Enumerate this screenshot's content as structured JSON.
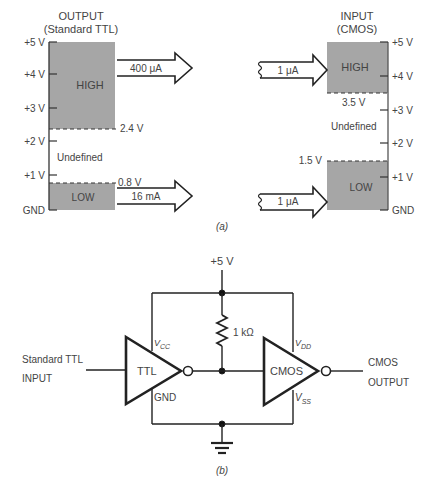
{
  "part_a": {
    "caption": "(a)",
    "output": {
      "title_line1": "OUTPUT",
      "title_line2": "(Standard TTL)",
      "axis_ticks": [
        "+5 V",
        "+4 V",
        "+3 V",
        "+2 V",
        "+1 V",
        "GND"
      ],
      "high_label": "HIGH",
      "low_label": "LOW",
      "undefined_label": "Undefined",
      "high_threshold": "2.4 V",
      "low_threshold": "0.8 V",
      "high_current": "400 μA",
      "low_current": "16 mA"
    },
    "input": {
      "title_line1": "INPUT",
      "title_line2": "(CMOS)",
      "axis_ticks": [
        "+5 V",
        "+4 V",
        "+3 V",
        "+2 V",
        "+1 V",
        "GND"
      ],
      "high_label": "HIGH",
      "low_label": "LOW",
      "undefined_label": "Undefined",
      "high_threshold": "3.5 V",
      "low_threshold": "1.5 V",
      "high_current": "1 μA",
      "low_current": "1 μA"
    },
    "colors": {
      "region_fill": "#a6a6a6",
      "line": "#333333"
    }
  },
  "part_b": {
    "caption": "(b)",
    "supply_label": "+5 V",
    "resistor_label": "1 kΩ",
    "input_label_line1": "Standard TTL",
    "input_label_line2": "INPUT",
    "output_label_line1": "CMOS",
    "output_label_line2": "OUTPUT",
    "ttl_gate": {
      "label": "TTL",
      "vcc": "V",
      "vcc_sub": "CC",
      "gnd": "GND"
    },
    "cmos_gate": {
      "label": "CMOS",
      "vdd": "V",
      "vdd_sub": "DD",
      "vss": "V",
      "vss_sub": "SS"
    }
  }
}
